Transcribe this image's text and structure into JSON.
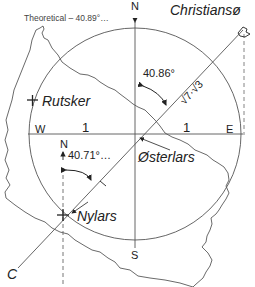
{
  "title": "Theoretical – 40.89°…",
  "compass": {
    "north": "N",
    "south": "S",
    "west": "W",
    "east": "E"
  },
  "scale": {
    "west_unit": "1",
    "east_unit": "1",
    "diagonal_unit": "1"
  },
  "places": {
    "christianso": "Christiansø",
    "rutsker": "Rutsker",
    "osterlars": "Østerlars",
    "nylars": "Nylars",
    "c_point": "C"
  },
  "angles": {
    "center_angle": "40.86°",
    "nylars_angle": "40.71°…",
    "nylars_north": "N"
  },
  "diagonal_length": "√7·√3",
  "colors": {
    "line": "#555555",
    "text": "#222222",
    "island": "#444444"
  }
}
